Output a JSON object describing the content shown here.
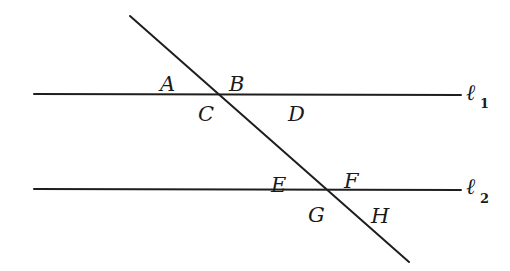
{
  "diagram": {
    "stroke_color": "#1e1e1e",
    "background": "#ffffff",
    "lines": {
      "l1": {
        "name": "ℓ",
        "subscript": "1",
        "x1": 34,
        "y1": 94,
        "x2": 461,
        "y2": 95
      },
      "l2": {
        "name": "ℓ",
        "subscript": "2",
        "x1": 34,
        "y1": 189,
        "x2": 461,
        "y2": 190
      },
      "transversal": {
        "x1": 130,
        "y1": 16,
        "x2": 409,
        "y2": 262
      }
    },
    "intersections": [
      {
        "id": "P1",
        "x": 218,
        "y": 94,
        "on": "l1"
      },
      {
        "id": "P2",
        "x": 328,
        "y": 190,
        "on": "l2"
      }
    ],
    "angle_labels": [
      {
        "text": "A",
        "x": 160,
        "y": 91
      },
      {
        "text": "B",
        "x": 229,
        "y": 91
      },
      {
        "text": "C",
        "x": 198,
        "y": 121
      },
      {
        "text": "D",
        "x": 288,
        "y": 121
      },
      {
        "text": "E",
        "x": 271,
        "y": 192
      },
      {
        "text": "F",
        "x": 344,
        "y": 188
      },
      {
        "text": "G",
        "x": 308,
        "y": 222
      },
      {
        "text": "H",
        "x": 371,
        "y": 223
      }
    ],
    "line_labels": [
      {
        "text": "ℓ",
        "sub": "1",
        "x": 466,
        "y": 100,
        "sub_x": 480,
        "sub_y": 108
      },
      {
        "text": "ℓ",
        "sub": "2",
        "x": 466,
        "y": 194,
        "sub_x": 480,
        "sub_y": 203
      }
    ]
  }
}
